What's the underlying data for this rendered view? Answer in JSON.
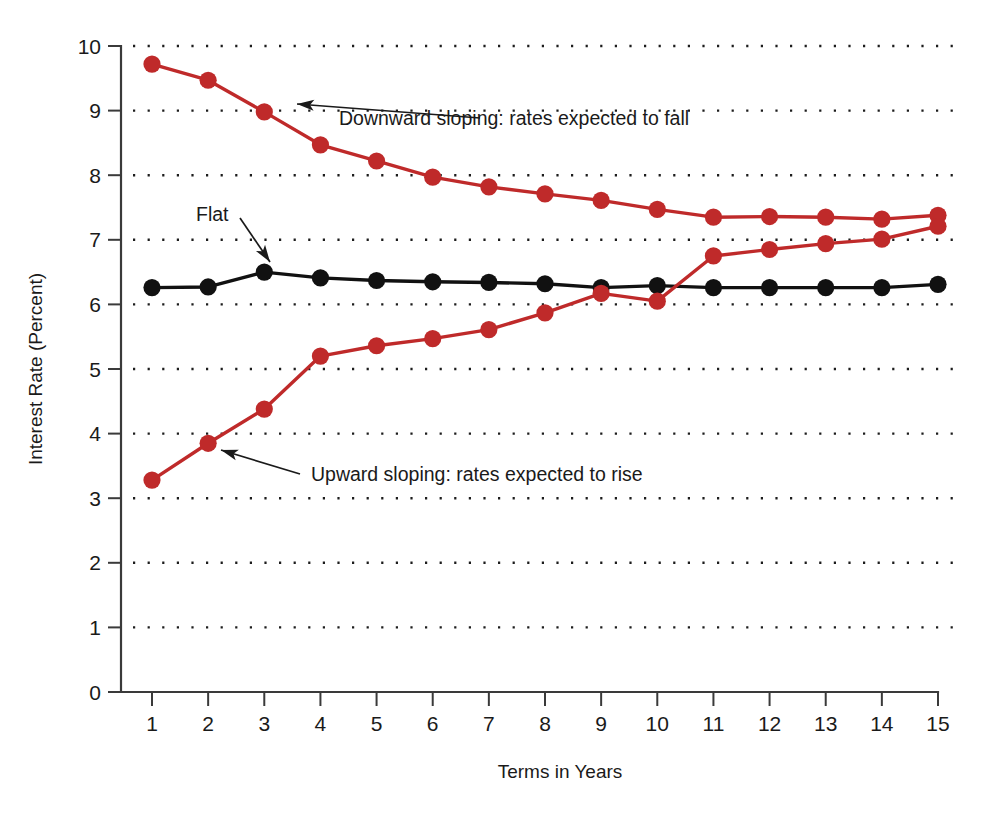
{
  "chart_data": {
    "type": "line",
    "title": "",
    "subtitle": "",
    "xlabel": "Terms in Years",
    "ylabel": "Interest Rate (Percent)",
    "x": [
      1,
      2,
      3,
      4,
      5,
      6,
      7,
      8,
      9,
      10,
      11,
      12,
      13,
      14,
      15
    ],
    "categories": [
      "1",
      "2",
      "3",
      "4",
      "5",
      "6",
      "7",
      "8",
      "9",
      "10",
      "11",
      "12",
      "13",
      "14",
      "15"
    ],
    "xlim": [
      0.6,
      15.4
    ],
    "ylim": [
      0,
      10
    ],
    "xticks": [
      1,
      2,
      3,
      4,
      5,
      6,
      7,
      8,
      9,
      10,
      11,
      12,
      13,
      14,
      15
    ],
    "yticks": [
      0,
      1,
      2,
      3,
      4,
      5,
      6,
      7,
      8,
      9,
      10
    ],
    "ytick_labels": [
      "0",
      "1",
      "2",
      "3",
      "4",
      "5",
      "6",
      "7",
      "8",
      "9",
      "10"
    ],
    "grid": "horizontal-dotted",
    "legend_position": "none",
    "series": [
      {
        "name": "Downward sloping",
        "color": "#bf2a2a",
        "marker": "circle",
        "values": [
          9.72,
          9.47,
          8.98,
          8.47,
          8.22,
          7.97,
          7.82,
          7.71,
          7.61,
          7.47,
          7.35,
          7.36,
          7.35,
          7.32,
          7.38
        ]
      },
      {
        "name": "Flat",
        "color": "#111111",
        "marker": "circle",
        "values": [
          6.26,
          6.27,
          6.5,
          6.41,
          6.37,
          6.35,
          6.34,
          6.32,
          6.26,
          6.29,
          6.26,
          6.26,
          6.26,
          6.26,
          6.31
        ]
      },
      {
        "name": "Upward sloping",
        "color": "#bf2a2a",
        "marker": "circle",
        "values": [
          3.28,
          3.85,
          4.38,
          5.2,
          5.36,
          5.47,
          5.61,
          5.87,
          6.17,
          6.05,
          6.75,
          6.85,
          6.94,
          7.01,
          7.21
        ]
      }
    ],
    "annotations": [
      {
        "id": "downward-annotation",
        "text": "Downward sloping:  rates expected to fall",
        "text_x": 339,
        "text_y": 125,
        "leader_from_x": 480,
        "leader_from_y": 118,
        "leader_to_x": 297,
        "leader_to_y": 104,
        "arrow_angle": 184
      },
      {
        "id": "flat-annotation",
        "text": "Flat",
        "text_x": 196,
        "text_y": 221,
        "leader_from_x": 240,
        "leader_from_y": 218,
        "leader_to_x": 270,
        "leader_to_y": 262,
        "arrow_angle": 56
      },
      {
        "id": "upward-annotation",
        "text": "Upward sloping:  rates expected to rise",
        "text_x": 311,
        "text_y": 481,
        "leader_from_x": 300,
        "leader_from_y": 474,
        "leader_to_x": 221,
        "leader_to_y": 450,
        "arrow_angle": 197
      }
    ]
  },
  "colors": {
    "series_red": "#bf2a2a",
    "series_black": "#111111",
    "axis": "#3a3a3a",
    "background": "#ffffff"
  }
}
